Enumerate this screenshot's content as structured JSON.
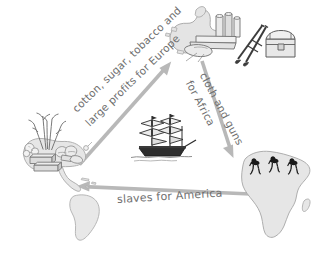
{
  "diagram": {
    "background_color": "#ffffff",
    "arrow_color": "#b3b3b3",
    "label_color": "#6e6e6e",
    "continent_fill": "#e2e2e2",
    "continent_stroke": "#9a9a9a",
    "figure_color": "#1a1a1a"
  },
  "labels": {
    "america_to_europe_line1": "cotton, sugar, tobacco and",
    "america_to_europe_line2": "large profits for Europe",
    "europe_to_africa_line1": "cloth and guns",
    "europe_to_africa_line2": "for Africa",
    "africa_to_america": "slaves for America"
  },
  "nodes": [
    {
      "id": "americas",
      "name": "americas-region",
      "icons": [
        "sugar-cane-icon",
        "cotton-boll-icon",
        "tobacco-leaf-icon",
        "goods-crate-icon"
      ]
    },
    {
      "id": "europe",
      "name": "europe-region",
      "icons": [
        "cloth-bolt-icon",
        "musket-icon",
        "treasure-chest-icon"
      ]
    },
    {
      "id": "africa",
      "name": "africa-region",
      "icons": [
        "enslaved-person-figure-icon"
      ]
    }
  ],
  "center_icon": {
    "name": "sailing-ship-icon",
    "label": "sailing ship"
  },
  "arrows": [
    {
      "id": "america-to-europe",
      "from": "americas",
      "to": "europe",
      "direction": "up-right"
    },
    {
      "id": "europe-to-africa",
      "from": "europe",
      "to": "africa",
      "direction": "down-right"
    },
    {
      "id": "africa-to-america",
      "from": "africa",
      "to": "americas",
      "direction": "left"
    }
  ]
}
